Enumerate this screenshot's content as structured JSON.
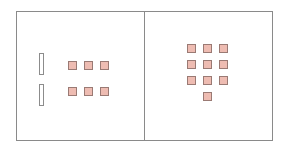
{
  "diagram": {
    "panels": [
      {
        "name": "left-panel",
        "box": {
          "x": 16,
          "y": 11,
          "w": 129,
          "h": 130
        },
        "slots": [
          {
            "x": 39,
            "y": 53
          },
          {
            "x": 39,
            "y": 84
          }
        ],
        "squares": [
          {
            "x": 68,
            "y": 61
          },
          {
            "x": 84,
            "y": 61
          },
          {
            "x": 100,
            "y": 61
          },
          {
            "x": 68,
            "y": 87
          },
          {
            "x": 84,
            "y": 87
          },
          {
            "x": 100,
            "y": 87
          }
        ]
      },
      {
        "name": "right-panel",
        "box": {
          "x": 144,
          "y": 11,
          "w": 129,
          "h": 130
        },
        "slots": [],
        "squares": [
          {
            "x": 187,
            "y": 44
          },
          {
            "x": 203,
            "y": 44
          },
          {
            "x": 219,
            "y": 44
          },
          {
            "x": 187,
            "y": 60
          },
          {
            "x": 203,
            "y": 60
          },
          {
            "x": 219,
            "y": 60
          },
          {
            "x": 187,
            "y": 76
          },
          {
            "x": 203,
            "y": 76
          },
          {
            "x": 219,
            "y": 76
          },
          {
            "x": 203,
            "y": 92
          }
        ]
      }
    ],
    "colors": {
      "square_fill": "#eebcb2",
      "square_border": "#9a7a74",
      "panel_border": "#8a8a8a"
    }
  }
}
